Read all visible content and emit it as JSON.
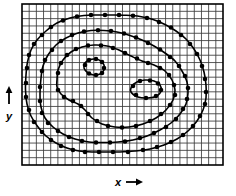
{
  "figure": {
    "kind": "contour-map",
    "background_color": "#ffffff",
    "ink_color": "#000000",
    "grid_color": "#3a3a3a",
    "frame": {
      "x": 22,
      "y": 4,
      "width": 201,
      "height": 161
    },
    "axes": {
      "x_label": "x",
      "x_arrow": "right-arrow-icon",
      "x_arrow_glyph": "→",
      "y_label": "y",
      "y_arrow": "up-arrow-icon",
      "y_arrow_glyph": "↑"
    },
    "grid": {
      "visible": true,
      "columns": 28,
      "rows": 22,
      "cell_width": 7.18,
      "cell_height": 7.32
    }
  },
  "chart_data": {
    "type": "line",
    "title": "",
    "xlabel": "x",
    "ylabel": "y",
    "grid": true,
    "legend": "none",
    "xlim": [
      0,
      28
    ],
    "ylim": [
      0,
      22
    ],
    "contours": [
      {
        "name": "contour-outer",
        "level_index": 1,
        "closed": true,
        "points": [
          [
            26.0,
            75.0
          ],
          [
            27.5,
            62.0
          ],
          [
            31.0,
            50.0
          ],
          [
            37.0,
            40.0
          ],
          [
            46.0,
            31.0
          ],
          [
            57.0,
            23.0
          ],
          [
            70.0,
            18.0
          ],
          [
            84.0,
            15.5
          ],
          [
            98.0,
            15.0
          ],
          [
            112.0,
            15.0
          ],
          [
            126.0,
            15.3
          ],
          [
            140.0,
            16.5
          ],
          [
            153.0,
            19.5
          ],
          [
            165.0,
            24.5
          ],
          [
            176.0,
            31.0
          ],
          [
            186.0,
            39.0
          ],
          [
            194.0,
            49.0
          ],
          [
            200.0,
            60.0
          ],
          [
            204.0,
            72.0
          ],
          [
            206.0,
            85.0
          ],
          [
            206.0,
            98.0
          ],
          [
            203.0,
            110.0
          ],
          [
            197.0,
            121.0
          ],
          [
            188.0,
            131.0
          ],
          [
            177.0,
            139.0
          ],
          [
            164.0,
            145.0
          ],
          [
            150.0,
            149.0
          ],
          [
            135.0,
            151.0
          ],
          [
            120.0,
            152.0
          ],
          [
            106.0,
            152.0
          ],
          [
            92.0,
            152.0
          ],
          [
            79.0,
            151.0
          ],
          [
            67.0,
            148.0
          ],
          [
            56.0,
            143.0
          ],
          [
            46.0,
            136.0
          ],
          [
            38.0,
            127.0
          ],
          [
            31.0,
            116.0
          ],
          [
            27.0,
            104.0
          ],
          [
            25.5,
            90.0
          ]
        ],
        "markers": [
          [
            27.0,
            68.0
          ],
          [
            29.0,
            55.0
          ],
          [
            34.0,
            44.0
          ],
          [
            42.0,
            35.0
          ],
          [
            51.0,
            27.0
          ],
          [
            63.0,
            20.5
          ],
          [
            77.0,
            16.5
          ],
          [
            91.0,
            15.0
          ],
          [
            105.0,
            15.0
          ],
          [
            119.0,
            15.0
          ],
          [
            133.0,
            15.8
          ],
          [
            147.0,
            18.0
          ],
          [
            159.0,
            22.0
          ],
          [
            171.0,
            27.5
          ],
          [
            181.0,
            35.0
          ],
          [
            190.0,
            44.0
          ],
          [
            197.0,
            54.0
          ],
          [
            202.0,
            66.0
          ],
          [
            205.0,
            79.0
          ],
          [
            206.0,
            92.0
          ],
          [
            205.0,
            104.0
          ],
          [
            200.0,
            116.0
          ],
          [
            193.0,
            126.0
          ],
          [
            183.0,
            135.0
          ],
          [
            171.0,
            142.0
          ],
          [
            157.0,
            147.0
          ],
          [
            143.0,
            150.0
          ],
          [
            128.0,
            152.0
          ],
          [
            113.0,
            152.0
          ],
          [
            99.0,
            152.0
          ],
          [
            85.0,
            152.0
          ],
          [
            73.0,
            150.0
          ],
          [
            61.0,
            146.0
          ],
          [
            51.0,
            140.0
          ],
          [
            42.0,
            132.0
          ],
          [
            34.0,
            122.0
          ],
          [
            29.0,
            110.0
          ],
          [
            26.0,
            97.0
          ],
          [
            26.0,
            83.0
          ]
        ]
      },
      {
        "name": "contour-second",
        "level_index": 2,
        "closed": true,
        "points": [
          [
            41.0,
            78.0
          ],
          [
            43.0,
            66.0
          ],
          [
            48.0,
            55.0
          ],
          [
            56.0,
            45.0
          ],
          [
            66.0,
            38.0
          ],
          [
            78.0,
            33.0
          ],
          [
            91.0,
            30.5
          ],
          [
            104.0,
            30.5
          ],
          [
            117.0,
            32.0
          ],
          [
            130.0,
            35.5
          ],
          [
            142.0,
            40.0
          ],
          [
            154.0,
            46.0
          ],
          [
            165.0,
            53.0
          ],
          [
            175.0,
            61.0
          ],
          [
            182.0,
            71.0
          ],
          [
            187.0,
            82.0
          ],
          [
            188.0,
            93.0
          ],
          [
            186.0,
            104.0
          ],
          [
            180.0,
            114.0
          ],
          [
            171.0,
            123.0
          ],
          [
            160.0,
            130.0
          ],
          [
            147.0,
            136.0
          ],
          [
            133.0,
            140.0
          ],
          [
            118.0,
            142.0
          ],
          [
            103.0,
            142.5
          ],
          [
            89.0,
            142.0
          ],
          [
            75.0,
            139.0
          ],
          [
            63.0,
            134.0
          ],
          [
            53.0,
            127.0
          ],
          [
            45.0,
            118.0
          ],
          [
            41.0,
            107.0
          ],
          [
            40.0,
            94.0
          ]
        ],
        "markers": [
          [
            42.0,
            71.0
          ],
          [
            45.0,
            60.0
          ],
          [
            52.0,
            50.0
          ],
          [
            61.0,
            41.0
          ],
          [
            72.0,
            35.0
          ],
          [
            84.0,
            31.5
          ],
          [
            98.0,
            30.3
          ],
          [
            111.0,
            31.0
          ],
          [
            124.0,
            33.5
          ],
          [
            136.0,
            37.5
          ],
          [
            148.0,
            43.0
          ],
          [
            160.0,
            49.5
          ],
          [
            170.0,
            57.0
          ],
          [
            179.0,
            66.0
          ],
          [
            185.0,
            76.0
          ],
          [
            188.0,
            88.0
          ],
          [
            187.0,
            99.0
          ],
          [
            183.0,
            109.0
          ],
          [
            176.0,
            119.0
          ],
          [
            166.0,
            127.0
          ],
          [
            154.0,
            133.0
          ],
          [
            140.0,
            138.0
          ],
          [
            125.0,
            141.5
          ],
          [
            110.0,
            142.5
          ],
          [
            96.0,
            142.5
          ],
          [
            82.0,
            141.0
          ],
          [
            69.0,
            137.0
          ],
          [
            58.0,
            131.0
          ],
          [
            48.0,
            123.0
          ],
          [
            42.0,
            113.0
          ],
          [
            40.0,
            101.0
          ],
          [
            40.0,
            87.0
          ]
        ]
      },
      {
        "name": "contour-third-saddle",
        "level_index": 3,
        "closed": true,
        "description": "Peanut-shaped contour enclosing both extrema with a pinched saddle in the middle",
        "points": [
          [
            57.0,
            80.0
          ],
          [
            58.0,
            70.0
          ],
          [
            63.0,
            60.0
          ],
          [
            71.0,
            52.0
          ],
          [
            82.0,
            47.0
          ],
          [
            94.0,
            45.0
          ],
          [
            107.0,
            46.0
          ],
          [
            119.0,
            50.0
          ],
          [
            131.0,
            56.0
          ],
          [
            142.0,
            61.0
          ],
          [
            154.0,
            65.0
          ],
          [
            165.0,
            71.0
          ],
          [
            172.0,
            80.0
          ],
          [
            175.0,
            90.0
          ],
          [
            173.0,
            100.0
          ],
          [
            166.0,
            110.0
          ],
          [
            156.0,
            118.0
          ],
          [
            143.0,
            124.0
          ],
          [
            129.0,
            127.0
          ],
          [
            115.0,
            127.0
          ],
          [
            102.0,
            124.0
          ],
          [
            92.0,
            118.0
          ],
          [
            85.0,
            110.0
          ],
          [
            78.0,
            104.0
          ],
          [
            69.0,
            100.0
          ],
          [
            61.0,
            94.0
          ],
          [
            57.0,
            87.0
          ]
        ],
        "markers": [
          [
            58.0,
            73.0
          ],
          [
            61.0,
            63.0
          ],
          [
            67.0,
            55.0
          ],
          [
            76.0,
            49.0
          ],
          [
            88.0,
            45.5
          ],
          [
            101.0,
            45.5
          ],
          [
            113.0,
            48.0
          ],
          [
            125.0,
            53.0
          ],
          [
            137.0,
            58.5
          ],
          [
            148.0,
            63.0
          ],
          [
            160.0,
            68.0
          ],
          [
            169.0,
            75.0
          ],
          [
            174.0,
            85.0
          ],
          [
            175.0,
            95.0
          ],
          [
            170.0,
            105.0
          ],
          [
            161.0,
            114.0
          ],
          [
            150.0,
            121.0
          ],
          [
            136.0,
            126.0
          ],
          [
            122.0,
            127.5
          ],
          [
            108.0,
            126.0
          ],
          [
            97.0,
            121.0
          ],
          [
            88.0,
            114.0
          ],
          [
            81.0,
            106.0
          ],
          [
            73.0,
            101.0
          ],
          [
            64.0,
            97.0
          ],
          [
            58.0,
            90.0
          ]
        ]
      },
      {
        "name": "contour-inner-left-peak",
        "level_index": 4,
        "closed": true,
        "description": "Small oval around the left local extremum",
        "points": [
          [
            84.0,
            68.0
          ],
          [
            85.0,
            63.0
          ],
          [
            89.0,
            60.0
          ],
          [
            95.0,
            59.0
          ],
          [
            101.0,
            61.0
          ],
          [
            104.0,
            65.0
          ],
          [
            104.0,
            70.0
          ],
          [
            100.0,
            74.0
          ],
          [
            94.0,
            75.0
          ],
          [
            88.0,
            73.0
          ]
        ],
        "markers": [
          [
            85.0,
            65.0
          ],
          [
            89.0,
            60.0
          ],
          [
            96.0,
            59.0
          ],
          [
            102.0,
            62.0
          ],
          [
            104.0,
            68.0
          ],
          [
            102.0,
            73.0
          ],
          [
            96.0,
            75.0
          ],
          [
            89.0,
            73.5
          ]
        ]
      },
      {
        "name": "contour-inner-right-peak",
        "level_index": 5,
        "closed": true,
        "description": "Small oval around the right local extremum",
        "points": [
          [
            131.0,
            92.0
          ],
          [
            132.0,
            86.0
          ],
          [
            137.0,
            82.0
          ],
          [
            145.0,
            80.0
          ],
          [
            154.0,
            81.0
          ],
          [
            160.0,
            85.0
          ],
          [
            161.0,
            91.0
          ],
          [
            157.0,
            96.0
          ],
          [
            148.0,
            98.0
          ],
          [
            138.0,
            97.0
          ]
        ],
        "markers": [
          [
            133.0,
            86.0
          ],
          [
            140.0,
            81.0
          ],
          [
            150.0,
            80.5
          ],
          [
            158.0,
            83.5
          ],
          [
            161.0,
            90.0
          ],
          [
            156.0,
            96.0
          ],
          [
            146.0,
            98.0
          ],
          [
            136.0,
            95.0
          ]
        ]
      }
    ]
  }
}
